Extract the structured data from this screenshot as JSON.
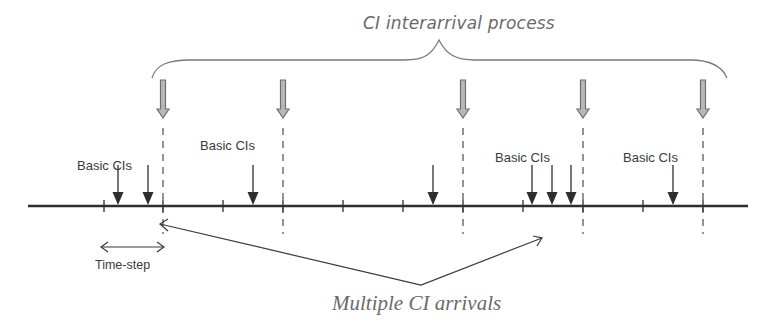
{
  "labels": {
    "top_title": "CI interarrival process",
    "bottom_title": "Multiple CI arrivals",
    "basic_cis": [
      "Basic CIs",
      "Basic CIs",
      "Basic CIs",
      "Basic CIs"
    ],
    "time_step": "Time-step"
  },
  "timeline": {
    "ticks_x": [
      104,
      163,
      223,
      283,
      343,
      403,
      463,
      523,
      583,
      643,
      703
    ],
    "ci_arrival_x": [
      163,
      283,
      463,
      583,
      703
    ],
    "basic_ci_arrow_x": [
      118,
      148,
      253,
      433,
      532,
      552,
      571,
      673
    ]
  },
  "colors": {
    "line": "#2e2e2e",
    "hollow_arrow": "#7a7a7a",
    "text": "#3a3a3a",
    "italic_text": "#6a6a6a"
  }
}
